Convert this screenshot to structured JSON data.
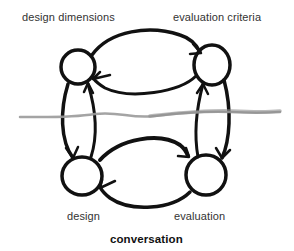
{
  "diagram": {
    "nodes": [
      {
        "id": "design-dimensions",
        "label": "design dimensions",
        "position": "top-left"
      },
      {
        "id": "evaluation-criteria",
        "label": "evaluation criteria",
        "position": "top-right"
      },
      {
        "id": "design",
        "label": "design",
        "position": "bottom-left"
      },
      {
        "id": "evaluation",
        "label": "evaluation",
        "position": "bottom-right"
      }
    ],
    "edges": [
      {
        "from": "design-dimensions",
        "to": "evaluation-criteria"
      },
      {
        "from": "evaluation-criteria",
        "to": "design-dimensions"
      },
      {
        "from": "design-dimensions",
        "to": "design"
      },
      {
        "from": "design",
        "to": "design-dimensions"
      },
      {
        "from": "evaluation-criteria",
        "to": "evaluation"
      },
      {
        "from": "evaluation",
        "to": "evaluation-criteria"
      },
      {
        "from": "design",
        "to": "evaluation"
      },
      {
        "from": "evaluation",
        "to": "design"
      }
    ],
    "divider": {
      "style": "gray hand-drawn line",
      "color": "#9a9a9a"
    },
    "caption": "conversation",
    "colors": {
      "stroke": "#111111",
      "divider": "#9a9a9a",
      "text": "#333333"
    }
  }
}
